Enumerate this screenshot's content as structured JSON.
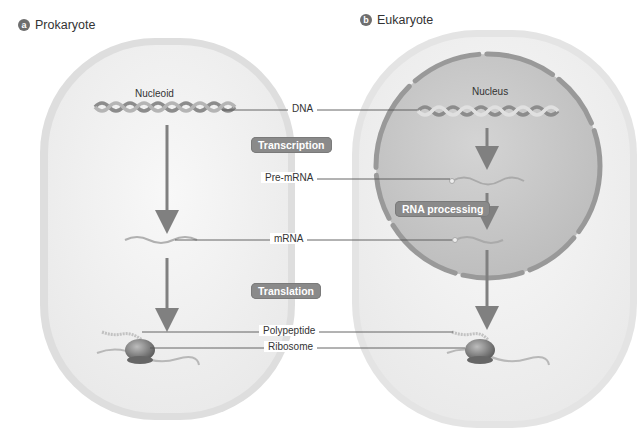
{
  "panels": {
    "prokaryote": {
      "badge": "a",
      "title": "Prokaryote",
      "region_label": "Nucleoid"
    },
    "eukaryote": {
      "badge": "b",
      "title": "Eukaryote",
      "region_label": "Nucleus"
    }
  },
  "center_labels": {
    "dna": "DNA",
    "pre_mrna": "Pre-mRNA",
    "mrna": "mRNA",
    "polypeptide": "Polypeptide",
    "ribosome": "Ribosome"
  },
  "process_steps": {
    "transcription": "Transcription",
    "rna_processing": "RNA processing",
    "translation": "Translation"
  },
  "colors": {
    "cell_fill": "#f3f3f3",
    "cell_wall": "#d9d9d9",
    "nucleus_fill": "#c9c9c9",
    "envelope": "#9a9a9a",
    "arrow": "#808080",
    "step_box": "#8a8a8a"
  }
}
